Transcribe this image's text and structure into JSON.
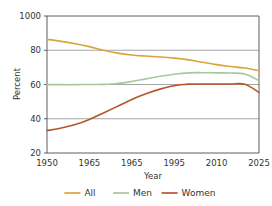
{
  "chart_data": {
    "type": "line",
    "title": "",
    "xlabel": "Year",
    "ylabel": "Percent",
    "xlim": [
      1950,
      2025
    ],
    "ylim": [
      20,
      100
    ],
    "grid": true,
    "gridlines_y": [
      40,
      60,
      80
    ],
    "legend_position": "bottom",
    "x_tick_labels": [
      "1950",
      "1965",
      "1965",
      "1995",
      "2010",
      "2025"
    ],
    "x_tick_values": [
      1950,
      1965,
      1980,
      1995,
      2010,
      2025
    ],
    "y_tick_labels": [
      "1000",
      "80",
      "60",
      "40",
      "20"
    ],
    "y_tick_values": [
      100,
      80,
      60,
      40,
      20
    ],
    "x": [
      1950,
      1955,
      1960,
      1965,
      1970,
      1975,
      1980,
      1985,
      1990,
      1995,
      2000,
      2005,
      2010,
      2015,
      2020,
      2025
    ],
    "series": [
      {
        "name": "All",
        "color": "#D9A43C",
        "values": [
          86.4,
          85.2,
          83.8,
          82.1,
          80.0,
          78.3,
          77.2,
          76.6,
          76.1,
          75.4,
          74.4,
          73.0,
          71.6,
          70.5,
          69.6,
          68.0
        ]
      },
      {
        "name": "Men",
        "color": "#A8C79B",
        "values": [
          59.9,
          59.9,
          59.9,
          60.0,
          60.1,
          60.6,
          61.8,
          63.3,
          64.8,
          66.0,
          66.8,
          66.9,
          66.8,
          66.7,
          66.1,
          62.3
        ]
      },
      {
        "name": "Women",
        "color": "#B5562A",
        "values": [
          33.1,
          34.6,
          36.6,
          39.6,
          43.4,
          47.3,
          51.3,
          54.6,
          57.3,
          59.3,
          60.2,
          60.3,
          60.3,
          60.3,
          60.1,
          55.4
        ]
      }
    ]
  },
  "legend": {
    "items": [
      {
        "label": "All",
        "color": "#D9A43C"
      },
      {
        "label": "Men",
        "color": "#A8C79B"
      },
      {
        "label": "Women",
        "color": "#B5562A"
      }
    ]
  },
  "axes": {
    "y_title": "Percent",
    "x_title": "Year"
  }
}
